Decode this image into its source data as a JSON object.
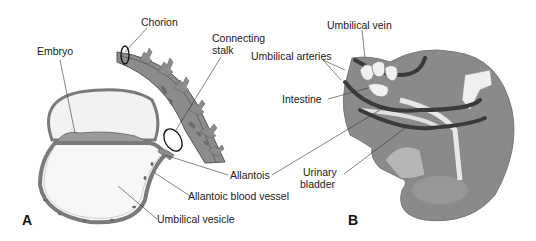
{
  "figure": {
    "panels": [
      {
        "id": "A",
        "letter": "A",
        "labels": {
          "chorion": "Chorion",
          "embryo": "Embryo",
          "connecting_stalk_1": "Connecting",
          "connecting_stalk_2": "stalk",
          "allantois": "Allantois",
          "allantoic_blood_vessel": "Allantoic blood vessel",
          "umbilical_vesicle": "Umbilical vesicle"
        }
      },
      {
        "id": "B",
        "letter": "B",
        "labels": {
          "umbilical_vein": "Umbilical vein",
          "umbilical_arteries": "Umbilical arteries",
          "intestine": "Intestine",
          "urinary_bladder_1": "Urinary",
          "urinary_bladder_2": "bladder"
        }
      }
    ],
    "colors": {
      "tissue_gray": "#8c8c8c",
      "dark_vessel": "#3a3a3a",
      "light_fill": "#f2f2f2",
      "outline": "#555555",
      "leader_line": "#333333"
    }
  }
}
